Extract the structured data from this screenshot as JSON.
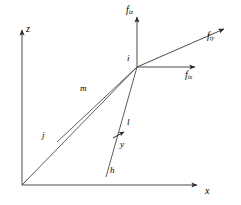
{
  "figure": {
    "background_color": "#ffffff",
    "line_color": "#3a3a3a",
    "text_color": "#000000"
  },
  "axes": {
    "z": {
      "label": "z",
      "x": 26,
      "y": 24
    },
    "x": {
      "label": "x",
      "x": 205,
      "y": 186
    }
  },
  "forces": [
    {
      "id": "fiz",
      "base": "f",
      "sub": "iz",
      "x": 126,
      "y": 5
    },
    {
      "id": "fiy",
      "base": "f",
      "sub": "iy",
      "x": 207,
      "y": 31
    },
    {
      "id": "fix",
      "base": "f",
      "sub": "ix",
      "x": 185,
      "y": 70
    }
  ],
  "nodes": [
    {
      "id": "i",
      "label": "i",
      "x": 127,
      "y": 54
    },
    {
      "id": "j",
      "label": "j",
      "x": 42,
      "y": 131
    },
    {
      "id": "h",
      "label": "h",
      "x": 110,
      "y": 166
    },
    {
      "id": "y",
      "label": "y",
      "x": 120,
      "y": 140
    },
    {
      "id": "l",
      "label": "l",
      "x": 127,
      "y": 118
    }
  ],
  "members": [
    {
      "id": "m",
      "label": "m",
      "x": 80,
      "y": 84
    }
  ],
  "geometry": {
    "origin": {
      "x": 22,
      "y": 185
    },
    "node_i": {
      "x": 137,
      "y": 67
    },
    "z_axis_tip": {
      "x": 22,
      "y": 28
    },
    "x_axis_tip": {
      "x": 201,
      "y": 185
    },
    "fiz_tip": {
      "x": 137,
      "y": 14
    },
    "fiy_tip": {
      "x": 228,
      "y": 26
    },
    "fix_tip": {
      "x": 199,
      "y": 67
    },
    "j_end": {
      "x": 57,
      "y": 142
    },
    "h_end": {
      "x": 106,
      "y": 163
    },
    "diagonal_tip": {
      "x": 149,
      "y": 120
    },
    "y_arrow_tip": {
      "x": 126,
      "y": 131
    }
  }
}
